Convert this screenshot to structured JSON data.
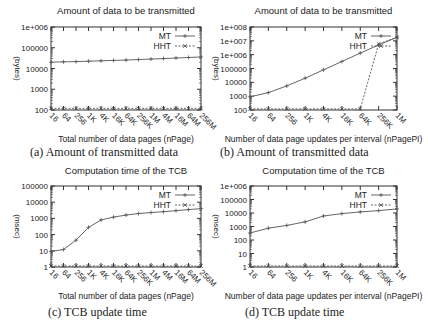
{
  "figure": {
    "panels": [
      {
        "id": "a",
        "caption": "(a) Amount of transmitted data"
      },
      {
        "id": "b",
        "caption": "(b) Amount of transmitted data"
      },
      {
        "id": "c",
        "caption": "(c) TCB update time"
      },
      {
        "id": "d",
        "caption": "(d) TCB update time"
      }
    ]
  },
  "chart_data": [
    {
      "id": "a",
      "type": "line",
      "title": "Amount of data to be transmitted",
      "xlabel": "Total number of data pages (nPage)",
      "ylabel": "(bytes)",
      "yscale": "log",
      "ylim": [
        100,
        1000000
      ],
      "yticks": [
        "100",
        "1000",
        "10000",
        "100000",
        "1e+006"
      ],
      "categories": [
        "16",
        "64",
        "256",
        "1K",
        "4K",
        "16K",
        "64K",
        "256K",
        "1M",
        "4M",
        "16M",
        "64M",
        "256M"
      ],
      "series": [
        {
          "name": "MT",
          "marker": "+",
          "values": [
            20000,
            21000,
            21500,
            22500,
            23500,
            24500,
            25500,
            27000,
            28500,
            30000,
            32000,
            34000,
            36000
          ]
        },
        {
          "name": "HHT",
          "marker": "x",
          "values": [
            120,
            120,
            120,
            120,
            120,
            120,
            120,
            120,
            120,
            120,
            120,
            120,
            120
          ]
        }
      ],
      "legend_position": "top-right",
      "grid": false
    },
    {
      "id": "b",
      "type": "line",
      "title": "Amount of data to be transmitted",
      "xlabel": "Number of data page updates per interval (nPagePI)",
      "ylabel": "(bytes)",
      "yscale": "log",
      "ylim": [
        100,
        100000000
      ],
      "yticks": [
        "100",
        "1000",
        "10000",
        "100000",
        "1e+006",
        "1e+007",
        "1e+008"
      ],
      "categories": [
        "16",
        "64",
        "256",
        "1K",
        "4K",
        "16K",
        "64K",
        "256K",
        "1M"
      ],
      "series": [
        {
          "name": "MT",
          "marker": "+",
          "values": [
            900,
            1800,
            5500,
            20000,
            80000,
            320000,
            1300000,
            5000000,
            18000000
          ]
        },
        {
          "name": "HHT",
          "marker": "x",
          "values": [
            120,
            120,
            120,
            120,
            120,
            120,
            120,
            6000000,
            18000000
          ]
        }
      ],
      "legend_position": "top-right",
      "grid": false
    },
    {
      "id": "c",
      "type": "line",
      "title": "Computation time of the TCB",
      "xlabel": "Total number of data pages (nPage)",
      "ylabel": "(msec)",
      "yscale": "log",
      "ylim": [
        1,
        100000
      ],
      "yticks": [
        "1",
        "10",
        "100",
        "1000",
        "10000",
        "100000"
      ],
      "categories": [
        "16",
        "64",
        "256",
        "1K",
        "4K",
        "16K",
        "64K",
        "256K",
        "1M",
        "4M",
        "16M",
        "64M",
        "256M"
      ],
      "series": [
        {
          "name": "MT",
          "marker": "+",
          "values": [
            9,
            12,
            45,
            280,
            800,
            1200,
            1600,
            2000,
            2300,
            2600,
            3000,
            3500,
            4000
          ]
        },
        {
          "name": "HHT",
          "marker": "x",
          "values": [
            1.1,
            1.1,
            1.1,
            1.1,
            1.1,
            1.1,
            1.1,
            1.1,
            1.1,
            1.1,
            1.1,
            1.1,
            1.1
          ]
        }
      ],
      "legend_position": "top-right",
      "grid": false
    },
    {
      "id": "d",
      "type": "line",
      "title": "Computation time of the TCB",
      "xlabel": "Number of data page updates per interval (nPagePI)",
      "ylabel": "(msec)",
      "yscale": "log",
      "ylim": [
        1,
        1000000
      ],
      "yticks": [
        "1",
        "10",
        "100",
        "1000",
        "10000",
        "100000",
        "1e+006"
      ],
      "categories": [
        "16",
        "64",
        "256",
        "1K",
        "4K",
        "16K",
        "64K",
        "256K",
        "1M"
      ],
      "series": [
        {
          "name": "MT",
          "marker": "+",
          "values": [
            330,
            750,
            1200,
            2200,
            6000,
            9000,
            12000,
            15000,
            20000
          ]
        },
        {
          "name": "HHT",
          "marker": "x",
          "values": [
            1.1,
            1.1,
            1.1,
            1.1,
            1.1,
            1.1,
            1.1,
            1.1,
            1.1
          ]
        }
      ],
      "legend_position": "top-right",
      "grid": false
    }
  ]
}
